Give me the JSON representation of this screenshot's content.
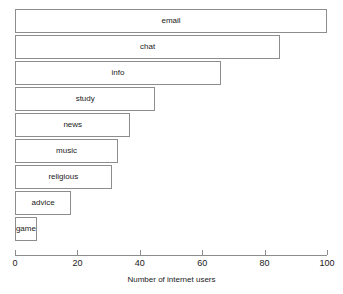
{
  "chart_data": {
    "type": "bar",
    "orientation": "horizontal",
    "title": "",
    "xlabel": "Number of internet users",
    "ylabel": "",
    "xlim": [
      0,
      100
    ],
    "grid": false,
    "legend": null,
    "categories": [
      "email",
      "chat",
      "info",
      "study",
      "news",
      "music",
      "religious",
      "advice",
      "game"
    ],
    "values": [
      100,
      85,
      66,
      45,
      37,
      33,
      31,
      18,
      7
    ],
    "xticks": [
      0,
      20,
      40,
      60,
      80,
      100
    ],
    "xticklabels": [
      "0",
      "20",
      "40",
      "60",
      "80",
      "100"
    ],
    "bar_fill_color": "#ffffff",
    "bar_border_color": "#8d8d8d",
    "axis_color": "#8d8d8d",
    "text_color": "#1a1a1a",
    "background_color": "#ffffff"
  }
}
